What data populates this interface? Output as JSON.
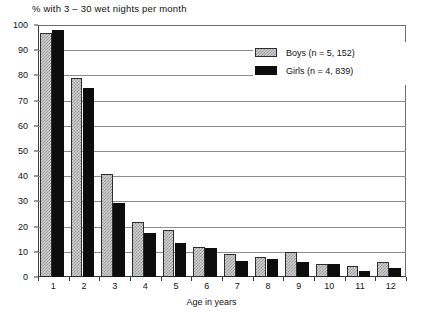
{
  "chart_data": {
    "type": "bar",
    "title": "% with 3 – 30 wet nights per month",
    "xlabel": "Age in years",
    "ylabel": "",
    "categories": [
      "1",
      "2",
      "3",
      "4",
      "5",
      "6",
      "7",
      "8",
      "9",
      "10",
      "11",
      "12"
    ],
    "ylim": [
      0,
      100
    ],
    "yticks": [
      "0",
      "10",
      "20",
      "30",
      "40",
      "50",
      "60",
      "70",
      "80",
      "90",
      "100"
    ],
    "grid": true,
    "legend_position": "top-right",
    "series": [
      {
        "name": "Boys (n = 5, 152)",
        "color": "#cfcfcf",
        "pattern": "checkered",
        "values": [
          97,
          79,
          41,
          22,
          18.5,
          12,
          9,
          8,
          10,
          5,
          4.5,
          6
        ]
      },
      {
        "name": "Girls (n = 4, 839)",
        "color": "#0d0d0d",
        "pattern": "solid",
        "values": [
          98,
          75,
          29.5,
          17.5,
          13.5,
          11.5,
          6.5,
          7,
          6,
          5,
          2.5,
          3.5
        ]
      }
    ]
  },
  "legend": {
    "items": [
      {
        "label": "Boys (n = 5, 152)",
        "swatch": "boys-swatch"
      },
      {
        "label": "Girls (n = 4, 839)",
        "swatch": "girls-swatch"
      }
    ]
  }
}
